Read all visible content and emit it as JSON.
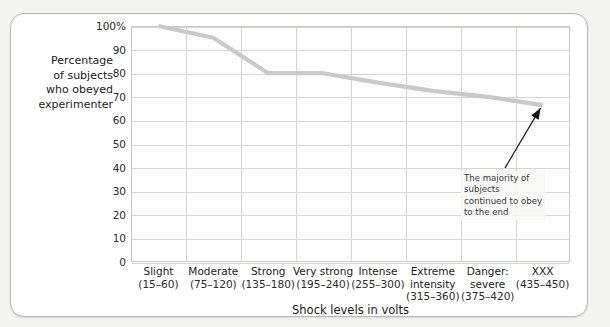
{
  "ylabel_lines": [
    "Percentage",
    "of subjects",
    "who obeyed",
    "experimenter"
  ],
  "annotation": "The majority of subjects continued to obey to the end",
  "chart_data": {
    "type": "line",
    "title": "",
    "xlabel": "Shock levels in volts",
    "ylabel": "Percentage of subjects who obeyed experimenter",
    "categories": [
      "Slight",
      "Moderate",
      "Strong",
      "Very strong",
      "Intense",
      "Extreme intensity",
      "Danger: severe",
      "XXX"
    ],
    "category_labels": [
      {
        "name": "Slight",
        "range": "(15–60)"
      },
      {
        "name": "Moderate",
        "range": "(75–120)"
      },
      {
        "name": "Strong",
        "range": "(135–180)"
      },
      {
        "name": "Very strong",
        "range": "(195–240)"
      },
      {
        "name": "Intense",
        "range": "(255–300)"
      },
      {
        "name": "Extreme intensity",
        "range": "(315–360)"
      },
      {
        "name": "Danger: severe",
        "range": "(375–420)"
      },
      {
        "name": "XXX",
        "range": "(435–450)"
      }
    ],
    "values": [
      100,
      95,
      80,
      80,
      76,
      72.5,
      70,
      66.5
    ],
    "ytick_labels": [
      "100%",
      "90",
      "80",
      "70",
      "60",
      "50",
      "40",
      "30",
      "20",
      "10",
      "0"
    ],
    "yticks": [
      100,
      90,
      80,
      70,
      60,
      50,
      40,
      30,
      20,
      10,
      0
    ],
    "ylim": [
      0,
      100
    ],
    "grid": true,
    "legend": "none",
    "series_color": "#c9c9c9",
    "annotations": [
      {
        "text": "The majority of subjects continued to obey to the end",
        "points_to_category": "XXX",
        "points_to_value": 66.5
      }
    ]
  },
  "colors": {
    "card_bg": "#ffffff",
    "page_bg": "#f4f4f2",
    "grid": "#d5d5d3",
    "line": "#c9c9c9",
    "text": "#1b1b1b"
  }
}
